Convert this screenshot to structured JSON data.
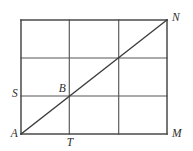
{
  "figure": {
    "name": "rectangle-grid-with-diagonal",
    "canvas": {
      "width": 193,
      "height": 151
    },
    "colors": {
      "background": "#ffffff",
      "grid_line": "#565656",
      "border_line": "#4a4a4a",
      "diagonal_line": "#3b3b3b",
      "label_text": "#2e2e2e"
    },
    "rectangle": {
      "left": 21,
      "right": 167,
      "top": 20,
      "bottom": 134,
      "columns": 3,
      "rows": 3
    },
    "grid": {
      "vertical_x": [
        21,
        69.3,
        118.7,
        167
      ],
      "horizontal_y": [
        20,
        58,
        96,
        134
      ]
    },
    "diagonal": {
      "from": "A",
      "to": "N",
      "x1": 21,
      "y1": 134,
      "x2": 167,
      "y2": 20
    },
    "points": [
      {
        "id": "N",
        "label": "N",
        "x": 167,
        "y": 20,
        "label_x": 172,
        "label_y": 21,
        "anchor": "start"
      },
      {
        "id": "S",
        "label": "S",
        "x": 21,
        "y": 96,
        "label_x": 18,
        "label_y": 97,
        "anchor": "end"
      },
      {
        "id": "B",
        "label": "B",
        "x": 69.3,
        "y": 96,
        "label_x": 66,
        "label_y": 92,
        "anchor": "end"
      },
      {
        "id": "A",
        "label": "A",
        "x": 21,
        "y": 134,
        "label_x": 18,
        "label_y": 137,
        "anchor": "end"
      },
      {
        "id": "T",
        "label": "T",
        "x": 69.3,
        "y": 134,
        "label_x": 70,
        "label_y": 146,
        "anchor": "middle"
      },
      {
        "id": "M",
        "label": "M",
        "x": 167,
        "y": 134,
        "label_x": 172,
        "label_y": 137,
        "anchor": "start"
      }
    ]
  }
}
